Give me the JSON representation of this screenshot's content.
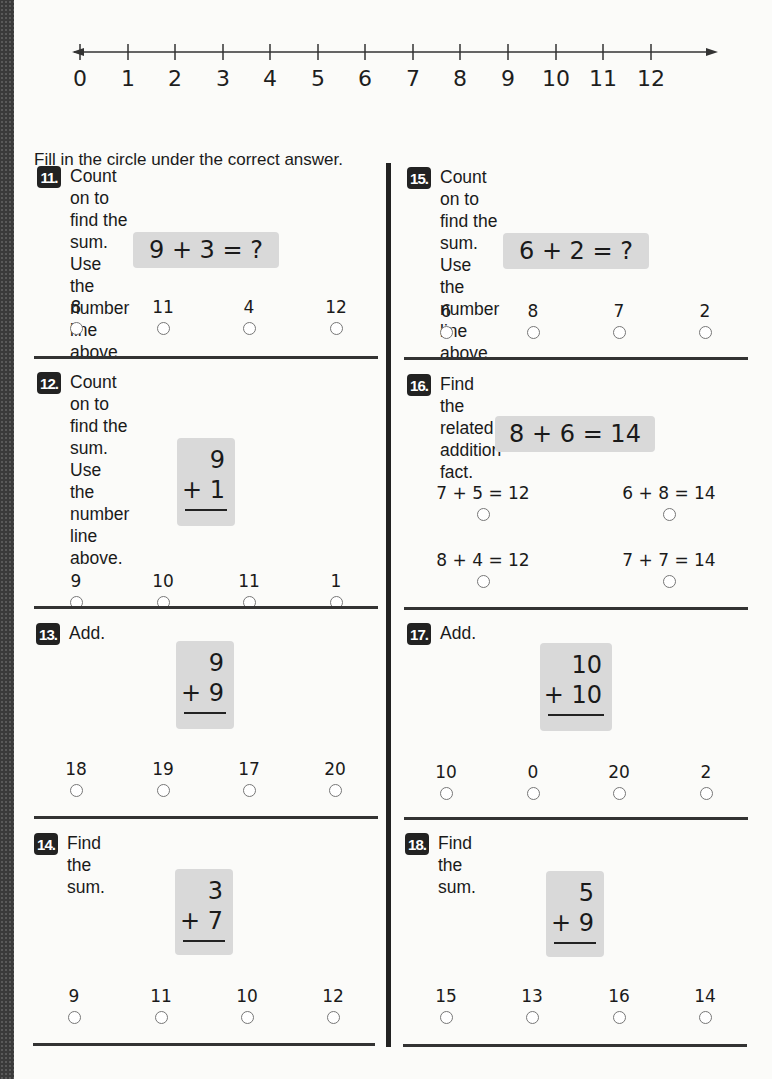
{
  "number_line": {
    "labels": [
      "0",
      "1",
      "2",
      "3",
      "4",
      "5",
      "6",
      "7",
      "8",
      "9",
      "10",
      "11",
      "12"
    ]
  },
  "instructions": "Fill in the circle under the correct answer.",
  "problems": [
    {
      "num": "11.",
      "prompt": [
        "Count on to find the sum.",
        "Use the number line above."
      ],
      "expression": "9 + 3 = ?",
      "choices": [
        "8",
        "11",
        "4",
        "12"
      ]
    },
    {
      "num": "12.",
      "prompt": [
        "Count on to find the sum.",
        "Use the number line above."
      ],
      "top": "9",
      "bottom": "+ 1",
      "choices": [
        "9",
        "10",
        "11",
        "1"
      ]
    },
    {
      "num": "13.",
      "prompt": [
        "Add."
      ],
      "top": "9",
      "bottom": "+ 9",
      "choices": [
        "18",
        "19",
        "17",
        "20"
      ]
    },
    {
      "num": "14.",
      "prompt": [
        "Find the sum."
      ],
      "top": "3",
      "bottom": "+ 7",
      "choices": [
        "9",
        "11",
        "10",
        "12"
      ]
    },
    {
      "num": "15.",
      "prompt": [
        "Count on to find the sum.",
        "Use the number line above."
      ],
      "expression": "6 + 2 = ?",
      "choices": [
        "6",
        "8",
        "7",
        "2"
      ]
    },
    {
      "num": "16.",
      "prompt": [
        "Find the related addition fact."
      ],
      "expression": "8 + 6 = 14",
      "choices": [
        "7 + 5 = 12",
        "6 + 8 = 14",
        "8 + 4 = 12",
        "7 + 7 = 14"
      ]
    },
    {
      "num": "17.",
      "prompt": [
        "Add."
      ],
      "top": "10",
      "bottom": "+ 10",
      "choices": [
        "10",
        "0",
        "20",
        "2"
      ]
    },
    {
      "num": "18.",
      "prompt": [
        "Find the sum."
      ],
      "top": "5",
      "bottom": "+ 9",
      "choices": [
        "15",
        "13",
        "16",
        "14"
      ]
    }
  ]
}
